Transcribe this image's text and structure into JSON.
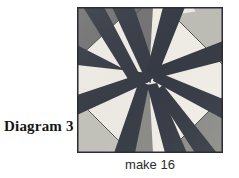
{
  "figure": {
    "label": "Diagram 3",
    "caption": "make 16",
    "kind": "quilt-block-diagram"
  },
  "block": {
    "name": "pinwheel-star-block",
    "border_color": "#2b2b33",
    "palette": {
      "dark_navy": "#3a3f४a",
      "dark_stripe": "#383c46",
      "dark_gray": "#6f6f6f",
      "medium_gray": "#8a8a8a",
      "light_gray": "#b9b9b4",
      "pale_gray": "#c9c9c3",
      "cream": "#f2f0e8",
      "seam_line": "#4a4a4a"
    },
    "regions": [
      {
        "name": "corner-top-left",
        "fabric": "dark gray",
        "color": "#737373"
      },
      {
        "name": "corner-top-right",
        "fabric": "light gray",
        "color": "#c2c2bb"
      },
      {
        "name": "corner-bottom-left",
        "fabric": "light gray",
        "color": "#c7c7c0"
      },
      {
        "name": "corner-bottom-right",
        "fabric": "medium gray",
        "color": "#8d8d8a"
      },
      {
        "name": "band-upper-left",
        "fabric": "cream",
        "color": "#f2f0e8"
      },
      {
        "name": "band-upper-right",
        "fabric": "cream",
        "color": "#f4f2ea"
      },
      {
        "name": "band-lower-left",
        "fabric": "cream",
        "color": "#f2f0e8"
      },
      {
        "name": "band-lower-right",
        "fabric": "cream",
        "color": "#f4f2ea"
      },
      {
        "name": "stripe-upper-left",
        "fabric": "dark navy",
        "color": "#3a3e48"
      },
      {
        "name": "stripe-upper-right",
        "fabric": "dark navy",
        "color": "#383c46"
      },
      {
        "name": "stripe-lower-left",
        "fabric": "dark navy",
        "color": "#3a3e48"
      },
      {
        "name": "stripe-lower-right",
        "fabric": "dark navy",
        "color": "#383c46"
      }
    ]
  }
}
